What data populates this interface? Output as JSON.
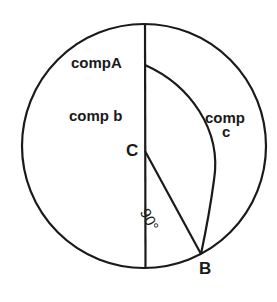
{
  "diagram": {
    "type": "napier-circle-construction",
    "stroke_color": "#1a1a1a",
    "background": "#ffffff",
    "labels": {
      "comp_a": "compA",
      "comp_b": "comp b",
      "comp_c_line1": "comp",
      "comp_c_line2": "c",
      "point_c": "C",
      "point_b": "B",
      "angle": "90°"
    },
    "points": {
      "A": {
        "label": "A",
        "x": 145,
        "y": 65
      },
      "B": {
        "label": "B",
        "x": 201,
        "y": 254
      },
      "C": {
        "label": "C",
        "x": 145,
        "y": 151
      }
    },
    "circle": {
      "cx": 144,
      "cy": 146,
      "r": 122
    },
    "segments": [
      {
        "name": "diameter",
        "from": [
          145,
          24
        ],
        "to": [
          145,
          269
        ]
      },
      {
        "name": "CB",
        "from": [
          145,
          151
        ],
        "to": [
          201,
          254
        ]
      }
    ],
    "arcs": [
      {
        "name": "arc-AB",
        "from": "A",
        "to": "B",
        "bulge": "right"
      }
    ]
  }
}
